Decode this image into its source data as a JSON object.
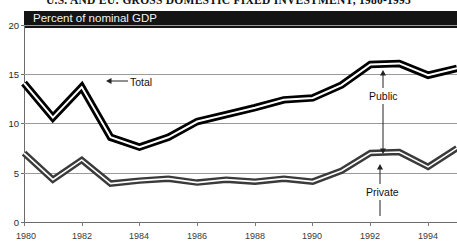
{
  "figure": {
    "title": "U.S. AND EU: GROSS DOMESTIC FIXED INVESTMENT, 1980-1995",
    "header_band_label": "Percent of nominal GDP"
  },
  "axes": {
    "y_ticks": [
      "20",
      "15",
      "10",
      "5",
      "0"
    ],
    "y_values": [
      20,
      15,
      10,
      5,
      0
    ],
    "x_ticks": [
      "1980",
      "1982",
      "1984",
      "1986",
      "1988",
      "1990",
      "1992",
      "1994"
    ],
    "x_values": [
      1980,
      1982,
      1984,
      1986,
      1988,
      1990,
      1992,
      1994
    ]
  },
  "annotations": {
    "total": "Total",
    "public": "Public",
    "private": "Private"
  },
  "colors": {
    "band_header": "#141414",
    "total_line": "#000000",
    "private_line": "#3a3a3a",
    "gridline": "#9a9a9a",
    "axis": "#6b6b6b"
  },
  "chart_data": {
    "type": "line",
    "title": "U.S. AND EU: GROSS DOMESTIC FIXED INVESTMENT, 1980-1995",
    "subtitle": "Percent of nominal GDP",
    "xlabel": "",
    "ylabel": "Percent of nominal GDP",
    "xlim": [
      1980,
      1995
    ],
    "ylim": [
      0,
      20
    ],
    "ytick_interval": 5,
    "xtick_interval": 2,
    "grid": true,
    "legend": "annotated-inline",
    "x": [
      1980,
      1981,
      1982,
      1983,
      1984,
      1985,
      1986,
      1987,
      1988,
      1989,
      1990,
      1991,
      1992,
      1993,
      1994,
      1995
    ],
    "series": [
      {
        "name": "Total",
        "style": "thick-double-black-band",
        "values": [
          14.1,
          10.6,
          13.7,
          8.6,
          7.6,
          8.6,
          10.2,
          10.9,
          11.6,
          12.4,
          12.6,
          13.9,
          16.0,
          16.1,
          14.9,
          15.6
        ]
      },
      {
        "name": "Private",
        "style": "thick-double-gray-band",
        "values": [
          7.0,
          4.3,
          6.3,
          3.9,
          4.2,
          4.4,
          4.0,
          4.3,
          4.1,
          4.4,
          4.1,
          5.2,
          7.0,
          7.1,
          5.6,
          7.5
        ]
      }
    ],
    "annotation_notes": [
      {
        "label": "Total",
        "points_to_series": "Total",
        "at_x": 1982
      },
      {
        "label": "Public",
        "points_to": "gap between Total and Private bands",
        "at_x": 1992
      },
      {
        "label": "Private",
        "points_to_series": "Private",
        "at_x": 1993
      }
    ]
  }
}
